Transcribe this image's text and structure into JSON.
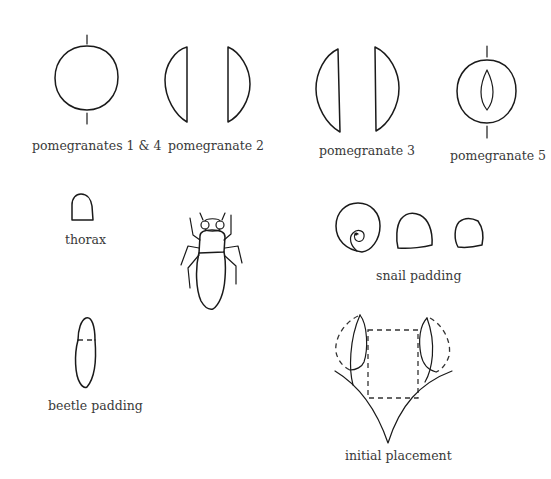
{
  "diagram": {
    "colors": {
      "line": "#1a1a1a",
      "label": "#3a3a3a",
      "background": "#ffffff"
    },
    "figures": [
      {
        "id": "pomegranates-1-4",
        "label": "pomegranates 1 & 4",
        "shape": "circle with dashed vertical axis"
      },
      {
        "id": "pomegranate-2",
        "label": "pomegranate 2",
        "shape": "two half-domes facing apart"
      },
      {
        "id": "pomegranate-3",
        "label": "pomegranate 3",
        "shape": "two taller half-domes facing apart"
      },
      {
        "id": "pomegranate-5",
        "label": "pomegranate 5",
        "shape": "circle with inner lens slit and dashed axis"
      },
      {
        "id": "thorax",
        "label": "thorax",
        "shape": "small dome"
      },
      {
        "id": "beetle",
        "label": "",
        "shape": "beetle with head, thorax, abdomen and six legs"
      },
      {
        "id": "snail-padding",
        "label": "snail padding",
        "shape": "spiral shell and two dome pads"
      },
      {
        "id": "beetle-padding",
        "label": "beetle padding",
        "shape": "elongated oval with dashed division"
      },
      {
        "id": "initial-placement",
        "label": "initial placement",
        "shape": "branching stem with two leaves and dashed rectangle"
      }
    ]
  }
}
